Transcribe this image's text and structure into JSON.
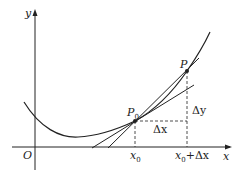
{
  "labels": {
    "y_axis": "y",
    "x_axis": "x",
    "origin": "O",
    "p0": "P",
    "p0_sub": "0",
    "p": "P",
    "delta_x": "Δx",
    "delta_y": "Δy",
    "x0": "x",
    "x0_sub": "0",
    "x0_dx_main": "x",
    "x0_dx_sub": "0",
    "x0_dx_rest": "+Δx"
  },
  "colors": {
    "stroke": "#222222",
    "background": "#ffffff"
  }
}
